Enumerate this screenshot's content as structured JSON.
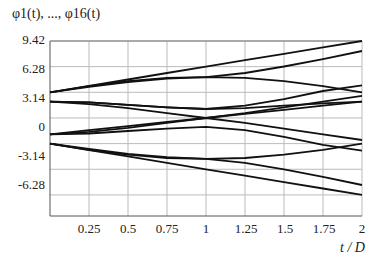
{
  "chart_data": {
    "type": "line",
    "title": "φ1(t), ..., φ16(t)",
    "xlabel": "t / D",
    "ylabel": "",
    "xlim": [
      0,
      2
    ],
    "ylim": [
      -9.42,
      9.42
    ],
    "x_ticks": [
      "0.25",
      "0.5",
      "0.75",
      "1",
      "1.25",
      "1.5",
      "1.75",
      "2"
    ],
    "y_ticks": [
      "9.42",
      "6.28",
      "3.14",
      "0",
      "-3.14",
      "-6.28"
    ],
    "grid": true,
    "x": [
      0,
      0.25,
      0.5,
      0.75,
      1,
      1.25,
      1.5,
      1.75,
      2
    ],
    "series": [
      {
        "name": "upper-line",
        "values": [
          3.14,
          3.93,
          4.71,
          5.5,
          6.28,
          7.07,
          7.85,
          8.64,
          9.42
        ]
      },
      {
        "name": "upper-arc-a",
        "values": [
          3.14,
          3.9,
          4.5,
          4.9,
          5.0,
          4.9,
          4.5,
          3.9,
          3.14
        ]
      },
      {
        "name": "upper-arc-b",
        "values": [
          3.14,
          3.8,
          4.4,
          4.8,
          5.0,
          5.5,
          6.3,
          7.2,
          8.2
        ]
      },
      {
        "name": "mid-upper-a",
        "values": [
          2.0,
          1.7,
          1.2,
          0.6,
          0.0,
          0.6,
          1.3,
          2.0,
          2.7
        ]
      },
      {
        "name": "mid-upper-b",
        "values": [
          2.0,
          1.9,
          1.6,
          1.3,
          1.1,
          1.2,
          1.5,
          1.8,
          2.0
        ]
      },
      {
        "name": "mid-upper-c",
        "values": [
          2.0,
          1.9,
          1.6,
          1.3,
          1.1,
          1.5,
          2.3,
          3.3,
          4.0
        ]
      },
      {
        "name": "mid-lower-a",
        "values": [
          -2.0,
          -1.7,
          -1.2,
          -0.6,
          0.0,
          -0.6,
          -1.3,
          -2.0,
          -2.7
        ]
      },
      {
        "name": "mid-lower-b",
        "values": [
          -2.0,
          -1.9,
          -1.6,
          -1.3,
          -1.1,
          -1.5,
          -2.3,
          -3.3,
          -4.0
        ]
      },
      {
        "name": "cross-down",
        "values": [
          -2.0,
          -1.5,
          -1.0,
          -0.5,
          0.0,
          0.5,
          1.0,
          1.5,
          2.0
        ]
      },
      {
        "name": "lower-arc-a",
        "values": [
          -3.14,
          -3.9,
          -4.5,
          -4.9,
          -5.0,
          -4.9,
          -4.5,
          -3.9,
          -3.14
        ]
      },
      {
        "name": "lower-arc-b",
        "values": [
          -3.14,
          -3.8,
          -4.4,
          -4.8,
          -5.0,
          -5.5,
          -6.3,
          -7.2,
          -8.2
        ]
      },
      {
        "name": "lower-line",
        "values": [
          -3.14,
          -3.93,
          -4.71,
          -5.5,
          -6.28,
          -7.07,
          -7.85,
          -8.64,
          -9.42
        ]
      }
    ]
  }
}
